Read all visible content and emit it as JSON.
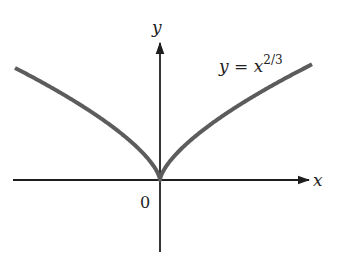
{
  "chart_data": {
    "type": "line",
    "title": "",
    "function": "y = x^(2/3)",
    "annotation": {
      "text_main": "y = x",
      "exponent": "2/3"
    },
    "xlabel": "x",
    "ylabel": "y",
    "origin_label": "0",
    "grid": false,
    "legend": null,
    "xlim": [
      -1.55,
      1.65
    ],
    "series": [
      {
        "name": "y = x^(2/3)",
        "x": [
          -1.45,
          -1.2,
          -1.0,
          -0.8,
          -0.6,
          -0.4,
          -0.2,
          -0.05,
          0,
          0.05,
          0.2,
          0.4,
          0.6,
          0.8,
          1.0,
          1.2,
          1.52
        ],
        "y": [
          1.281,
          1.129,
          1.0,
          0.862,
          0.711,
          0.543,
          0.342,
          0.136,
          0,
          0.136,
          0.342,
          0.543,
          0.711,
          0.862,
          1.0,
          1.129,
          1.322
        ]
      }
    ],
    "colors": {
      "curve": "#5c5c5c",
      "axes": "#1e1e1e"
    }
  }
}
